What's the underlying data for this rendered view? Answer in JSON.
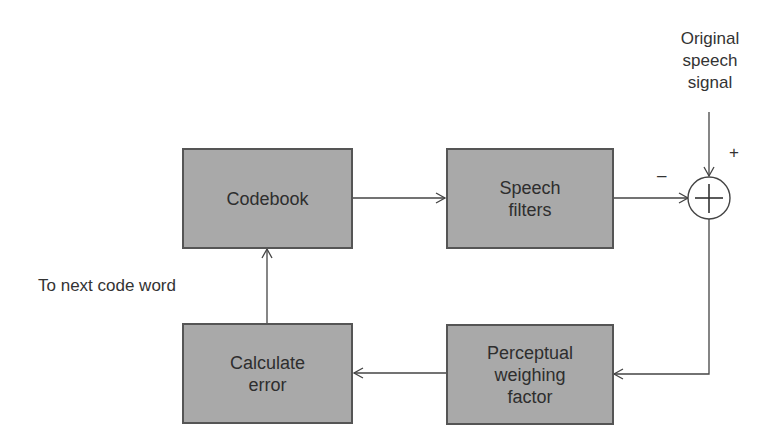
{
  "diagram": {
    "type": "block-diagram",
    "blocks": [
      {
        "id": "codebook",
        "label": "Codebook"
      },
      {
        "id": "speech_filters",
        "label": "Speech filters",
        "lines": [
          "Speech",
          "filters"
        ]
      },
      {
        "id": "calculate_error",
        "label": "Calculate error",
        "lines": [
          "Calculate",
          "error"
        ]
      },
      {
        "id": "perceptual_weighing",
        "label": "Perceptual weighing factor",
        "lines": [
          "Perceptual",
          "weighing",
          "factor"
        ]
      }
    ],
    "summing_junction": {
      "symbol": "+",
      "plus_sign": "+",
      "minus_sign": "–"
    },
    "input_label": {
      "lines": [
        "Original",
        "speech",
        "signal"
      ]
    },
    "loop_label": "To next code word",
    "edges": [
      {
        "from": "codebook",
        "to": "speech_filters"
      },
      {
        "from": "speech_filters",
        "to": "summing_junction",
        "sign": "-"
      },
      {
        "from": "original_speech_signal",
        "to": "summing_junction",
        "sign": "+"
      },
      {
        "from": "summing_junction",
        "to": "perceptual_weighing"
      },
      {
        "from": "perceptual_weighing",
        "to": "calculate_error"
      },
      {
        "from": "calculate_error",
        "to": "codebook"
      }
    ]
  }
}
